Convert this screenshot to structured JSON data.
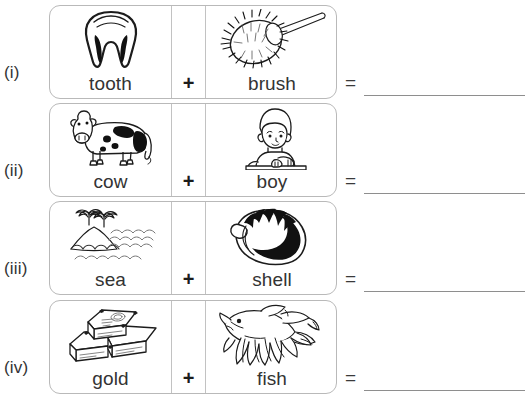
{
  "worksheet": {
    "symbols": {
      "plus": "+",
      "equals": "="
    },
    "problems": [
      {
        "numeral": "(i)",
        "left": {
          "word": "tooth",
          "icon": "tooth-icon"
        },
        "right": {
          "word": "brush",
          "icon": "brush-icon"
        },
        "answer": ""
      },
      {
        "numeral": "(ii)",
        "left": {
          "word": "cow",
          "icon": "cow-icon"
        },
        "right": {
          "word": "boy",
          "icon": "boy-icon"
        },
        "answer": ""
      },
      {
        "numeral": "(iii)",
        "left": {
          "word": "sea",
          "icon": "sea-icon"
        },
        "right": {
          "word": "shell",
          "icon": "shell-icon"
        },
        "answer": ""
      },
      {
        "numeral": "(iv)",
        "left": {
          "word": "gold",
          "icon": "gold-icon"
        },
        "right": {
          "word": "fish",
          "icon": "fish-icon"
        },
        "answer": ""
      }
    ],
    "colors": {
      "ink": "#333333",
      "card_border": "#b9b9b9",
      "divider": "#c2c2c2",
      "answer_rule": "#8e8e8e",
      "background": "#ffffff"
    }
  }
}
